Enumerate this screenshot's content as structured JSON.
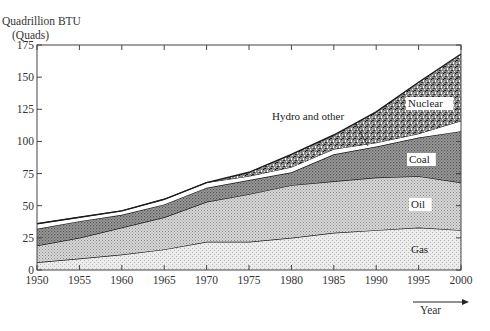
{
  "chart_data": {
    "type": "area",
    "stacked": true,
    "title": "",
    "ylabel": "Quadrillion BTU",
    "ylabel_units": "(Quads)",
    "xlabel": "Year",
    "x": [
      1950,
      1955,
      1960,
      1965,
      1970,
      1975,
      1980,
      1985,
      1990,
      1995,
      2000
    ],
    "xlim": [
      1950,
      2000
    ],
    "ylim": [
      0,
      175
    ],
    "x_ticks": [
      "1950",
      "1955",
      "1960",
      "1965",
      "1970",
      "1975",
      "1980",
      "1985",
      "1990",
      "1995",
      "2000"
    ],
    "y_ticks": [
      "0",
      "25",
      "50",
      "75",
      "100",
      "125",
      "150",
      "175"
    ],
    "grid": false,
    "series": [
      {
        "name": "Gas",
        "cumulative_top": [
          6,
          9,
          12,
          16,
          22,
          22,
          25,
          29,
          31,
          33,
          31
        ]
      },
      {
        "name": "Oil",
        "cumulative_top": [
          19,
          25,
          33,
          41,
          53,
          59,
          66,
          69,
          72,
          73,
          68
        ]
      },
      {
        "name": "Coal",
        "cumulative_top": [
          32,
          38,
          43,
          51,
          64,
          70,
          76,
          90,
          96,
          103,
          108
        ]
      },
      {
        "name": "Hydro and other",
        "cumulative_top": [
          36,
          41,
          46,
          55,
          68,
          73,
          80,
          94,
          99,
          106,
          116
        ]
      },
      {
        "name": "Nuclear",
        "cumulative_top": [
          36,
          41,
          46,
          55,
          68,
          76,
          90,
          105,
          123,
          146,
          168
        ]
      }
    ],
    "annotations": [
      "Nuclear",
      "Hydro and other",
      "Coal",
      "Oil",
      "Gas"
    ]
  },
  "labels": {
    "ylabel_line1": "Quadrillion BTU",
    "ylabel_line2": "(Quads)",
    "xlabel": "Year",
    "nuclear": "Nuclear",
    "hydro": "Hydro and other",
    "coal": "Coal",
    "oil": "Oil",
    "gas": "Gas"
  },
  "colors": {
    "gas": "#e4e4e4",
    "oil": "#c4c4c4",
    "coal": "#8e8e8e",
    "hydro": "#ffffff",
    "nuclear": "#6a6a6a"
  }
}
